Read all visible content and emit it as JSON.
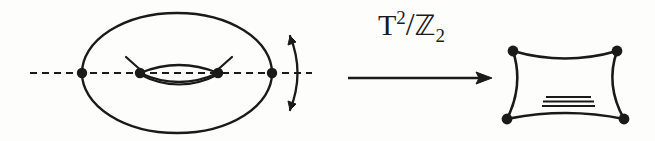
{
  "figure": {
    "background_color": "#fdfdfc",
    "ink_color": "#1a1a1a",
    "quotient_label": {
      "base": "T",
      "exponent": "2",
      "slash": "/",
      "group": "ℤ",
      "group_subscript": "2",
      "full_text": "T²/ℤ₂"
    },
    "left_panel": {
      "name": "torus-with-z2-axis",
      "outer_ellipse": {
        "cx": 177,
        "cy": 73,
        "rx": 95,
        "ry": 60
      },
      "symmetry_axis": {
        "x1": 30,
        "y1": 73,
        "x2": 312,
        "y2": 73,
        "style": "dashed"
      },
      "fixed_points": [
        {
          "label": "p1",
          "x": 82,
          "y": 73
        },
        {
          "label": "p2",
          "x": 140,
          "y": 73
        },
        {
          "label": "p3",
          "x": 218,
          "y": 73
        },
        {
          "label": "p4",
          "x": 272,
          "y": 73
        }
      ],
      "inner_hole": {
        "x1": 140,
        "x2": 218,
        "cy": 73,
        "bulge": 13
      },
      "tick_marks": [
        {
          "x1": 127,
          "y1": 58,
          "x2": 143,
          "y2": 72
        },
        {
          "x1": 215,
          "y1": 72,
          "x2": 231,
          "y2": 58
        }
      ],
      "rotation_arrow": {
        "name": "z2-rotation-arrow",
        "double_headed": true,
        "cx": 285,
        "cy": 73,
        "radius": 43,
        "start_angle_deg": -40,
        "end_angle_deg": 40
      }
    },
    "map_arrow": {
      "name": "quotient-map-arrow",
      "x1": 348,
      "y1": 78,
      "x2": 492,
      "y2": 78,
      "direction": "right"
    },
    "right_panel": {
      "name": "pillowcase-orbifold",
      "corners": [
        {
          "label": "c-top-left",
          "x": 513,
          "y": 51
        },
        {
          "label": "c-top-right",
          "x": 617,
          "y": 51
        },
        {
          "label": "c-bottom-right",
          "x": 624,
          "y": 119
        },
        {
          "label": "c-bottom-left",
          "x": 507,
          "y": 119
        }
      ],
      "edge_curvature": "concave-inward",
      "interior_lines": [
        {
          "x1": 545,
          "y1": 97,
          "x2": 592,
          "y2": 97
        },
        {
          "x1": 543,
          "y1": 101,
          "x2": 594,
          "y2": 101
        },
        {
          "x1": 542,
          "y1": 105,
          "x2": 595,
          "y2": 105
        }
      ]
    }
  }
}
